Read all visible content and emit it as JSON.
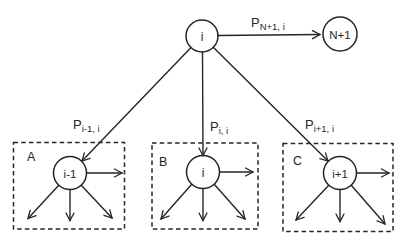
{
  "colors": {
    "line": "#262626",
    "background": "#ffffff"
  },
  "diagram": {
    "top_node": {
      "label": "i"
    },
    "exit_node": {
      "label": "N+1"
    },
    "edge_labels": {
      "exit": {
        "base": "P",
        "sub": "N+1, i"
      },
      "a": {
        "base": "P",
        "sub": "i-1, i"
      },
      "b": {
        "base": "P",
        "sub": "i, i"
      },
      "c": {
        "base": "P",
        "sub": "i+1, i"
      }
    },
    "boxes": [
      {
        "letter": "A",
        "node": "i-1"
      },
      {
        "letter": "B",
        "node": "i"
      },
      {
        "letter": "C",
        "node": "i+1"
      }
    ]
  }
}
